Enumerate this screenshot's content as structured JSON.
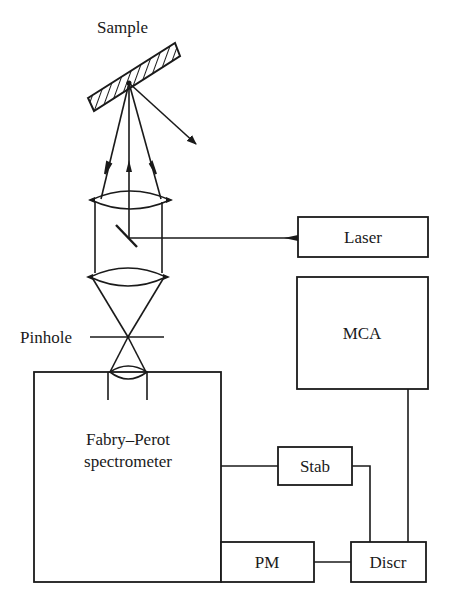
{
  "diagram": {
    "labels": {
      "sample": "Sample",
      "pinhole": "Pinhole",
      "laser": "Laser",
      "mca": "MCA",
      "fabry_perot_line1": "Fabry–Perot",
      "fabry_perot_line2": "spectrometer",
      "stab": "Stab",
      "pm": "PM",
      "discr": "Discr"
    },
    "components": [
      {
        "id": "sample",
        "type": "hatched-plate"
      },
      {
        "id": "upper-lens",
        "type": "lens"
      },
      {
        "id": "mirror",
        "type": "mirror"
      },
      {
        "id": "lower-lens",
        "type": "lens"
      },
      {
        "id": "pinhole",
        "type": "aperture"
      },
      {
        "id": "entrance-lens",
        "type": "lens"
      },
      {
        "id": "laser",
        "type": "box"
      },
      {
        "id": "mca",
        "type": "box"
      },
      {
        "id": "fabry-perot",
        "type": "box"
      },
      {
        "id": "stab",
        "type": "box"
      },
      {
        "id": "pm",
        "type": "box"
      },
      {
        "id": "discr",
        "type": "box"
      }
    ],
    "connections": [
      [
        "laser",
        "mirror"
      ],
      [
        "fabry-perot",
        "stab"
      ],
      [
        "stab",
        "discr"
      ],
      [
        "mca",
        "discr"
      ],
      [
        "pm",
        "discr"
      ],
      [
        "fabry-perot",
        "pm"
      ]
    ],
    "colors": {
      "ink": "#1a1a1a",
      "background": "#ffffff"
    }
  }
}
